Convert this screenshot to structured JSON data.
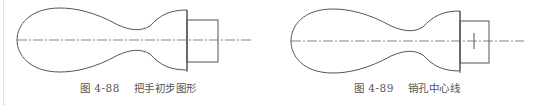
{
  "figures": [
    {
      "number": "图 4-88",
      "title": "把手初步图形",
      "shape": "handle-outline",
      "has_pin_centerline": false
    },
    {
      "number": "图 4-89",
      "title": "销孔中心线",
      "shape": "handle-outline",
      "has_pin_centerline": true
    }
  ],
  "colors": {
    "stroke": "#555555",
    "caption": "#555555",
    "page_margin_dots": "#c8c8c8"
  }
}
